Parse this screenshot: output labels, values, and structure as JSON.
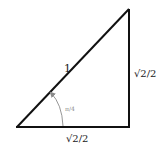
{
  "diagram": {
    "type": "right-triangle",
    "hypotenuse_label": "1",
    "vertical_leg_label": "√2/2",
    "horizontal_leg_label": "√2/2",
    "angle_label": "π/4",
    "colors": {
      "stroke": "#111111",
      "angle_arc": "#8a8a8a",
      "background": "#ffffff"
    }
  }
}
